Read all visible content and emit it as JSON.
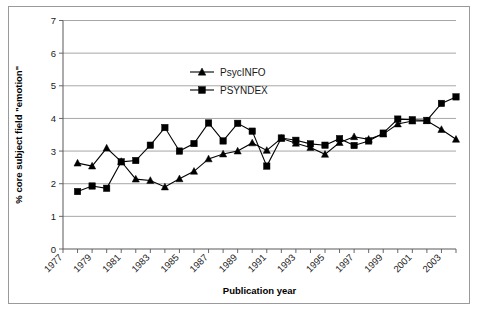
{
  "chart_data": {
    "type": "line",
    "title": "",
    "xlabel": "Publication year",
    "ylabel": "% core subject field \"emotion\"",
    "xlim": [
      1977,
      2004
    ],
    "ylim": [
      0,
      7
    ],
    "ytick_values": [
      0,
      1,
      2,
      3,
      4,
      5,
      6,
      7
    ],
    "ytick_labels": [
      "0",
      "1",
      "2",
      "3",
      "4",
      "5",
      "6",
      "7"
    ],
    "xtick_values": [
      1977,
      1979,
      1981,
      1983,
      1985,
      1987,
      1989,
      1991,
      1993,
      1995,
      1997,
      1999,
      2001,
      2003
    ],
    "xtick_labels": [
      "1977",
      "1979",
      "1981",
      "1983",
      "1985",
      "1987",
      "1989",
      "1991",
      "1993",
      "1995",
      "1997",
      "1999",
      "2001",
      "2003"
    ],
    "grid": "horizontal",
    "legend_position": "upper-center",
    "x": [
      1978,
      1979,
      1980,
      1981,
      1982,
      1983,
      1984,
      1985,
      1986,
      1987,
      1988,
      1989,
      1990,
      1991,
      1992,
      1993,
      1994,
      1995,
      1996,
      1997,
      1998,
      1999,
      2000,
      2001,
      2002,
      2003,
      2004
    ],
    "series": [
      {
        "name": "PsycINFO",
        "marker": "triangle",
        "values": [
          2.63,
          2.54,
          3.09,
          2.68,
          2.14,
          2.1,
          1.9,
          2.15,
          2.38,
          2.76,
          2.91,
          3.0,
          3.25,
          3.02,
          3.39,
          3.24,
          3.11,
          2.9,
          3.26,
          3.44,
          3.36,
          3.52,
          3.83,
          3.92,
          3.93,
          3.66,
          3.36
        ]
      },
      {
        "name": "PSYNDEX",
        "marker": "square",
        "values": [
          1.76,
          1.93,
          1.86,
          2.67,
          2.71,
          3.18,
          3.72,
          3.0,
          3.23,
          3.86,
          3.31,
          3.85,
          3.61,
          2.54,
          3.4,
          3.33,
          3.22,
          3.18,
          3.38,
          3.17,
          3.31,
          3.55,
          3.98,
          3.96,
          3.94,
          4.46,
          4.66
        ]
      }
    ]
  },
  "legend": {
    "entries": [
      {
        "label": "PsycINFO",
        "marker": "triangle"
      },
      {
        "label": "PSYNDEX",
        "marker": "square"
      }
    ]
  }
}
